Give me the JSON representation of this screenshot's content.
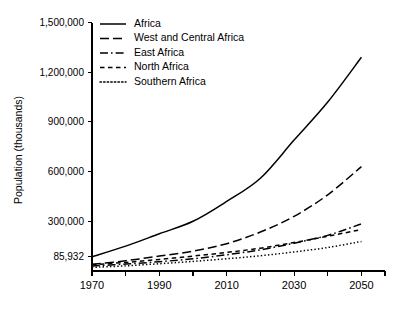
{
  "chart_data": {
    "type": "line",
    "title": "",
    "xlabel": "",
    "ylabel": "Population (thousands)",
    "x": [
      1970,
      1980,
      1990,
      2000,
      2010,
      2020,
      2030,
      2040,
      2050
    ],
    "xlim": [
      1970,
      2057
    ],
    "ylim": [
      0,
      1500000
    ],
    "xticks": [
      1970,
      1990,
      2010,
      2030,
      2050
    ],
    "xtick_labels": [
      "1970",
      "1990",
      "2010",
      "2030",
      "2050"
    ],
    "yticks": [
      85932,
      300000,
      600000,
      900000,
      1200000,
      1500000
    ],
    "ytick_labels": [
      "85,932",
      "300,000",
      "600,000",
      "900,000",
      "1,200,000",
      "1,500,000"
    ],
    "grid": false,
    "legend_position": "top-center",
    "series": [
      {
        "name": "Africa",
        "style": "solid",
        "values": [
          85932,
          150000,
          225000,
          300000,
          420000,
          560000,
          790000,
          1020000,
          1290000
        ]
      },
      {
        "name": "West and Central Africa",
        "style": "dashed-long",
        "values": [
          40000,
          62000,
          90000,
          120000,
          165000,
          235000,
          330000,
          460000,
          630000
        ]
      },
      {
        "name": "East Africa",
        "style": "dash-dot",
        "values": [
          30000,
          42000,
          56000,
          74000,
          98000,
          128000,
          168000,
          215000,
          285000
        ]
      },
      {
        "name": "North Africa",
        "style": "dashed-short",
        "values": [
          38000,
          52000,
          70000,
          90000,
          112000,
          138000,
          172000,
          210000,
          250000
        ]
      },
      {
        "name": "Southern Africa",
        "style": "dotted",
        "values": [
          22000,
          31000,
          44000,
          58000,
          74000,
          92000,
          115000,
          142000,
          178000
        ]
      }
    ]
  },
  "axes": {
    "ylabel": "Population (thousands)"
  },
  "legend": {
    "items": [
      {
        "label": "Africa"
      },
      {
        "label": "West and Central Africa"
      },
      {
        "label": "East Africa"
      },
      {
        "label": "North Africa"
      },
      {
        "label": "Southern Africa"
      }
    ]
  }
}
